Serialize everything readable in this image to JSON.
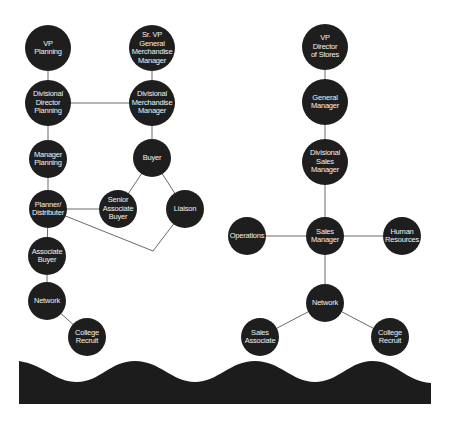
{
  "diagram": {
    "type": "org-chart",
    "colors": {
      "node": "#1e1e1e",
      "node_text": "#f2f2f2",
      "line": "#6a6a6a",
      "wave": "#1c1c1c",
      "background": "#ffffff"
    },
    "nodes": [
      {
        "id": "vp-planning",
        "label": "VP\nPlanning",
        "x": 48,
        "y": 48,
        "r": 23
      },
      {
        "id": "sr-vp-gmm",
        "label": "Sr. VP\nGeneral\nMerchandise\nManager",
        "x": 152,
        "y": 48,
        "r": 23
      },
      {
        "id": "div-director-planning",
        "label": "Divisional\nDirector\nPlanning",
        "x": 48,
        "y": 103,
        "r": 23
      },
      {
        "id": "div-merch-manager",
        "label": "Divisional\nMerchandise\nManager",
        "x": 152,
        "y": 103,
        "r": 23
      },
      {
        "id": "manager-planning",
        "label": "Manager\nPlanning",
        "x": 48,
        "y": 159,
        "r": 19
      },
      {
        "id": "buyer",
        "label": "Buyer",
        "x": 152,
        "y": 158,
        "r": 19
      },
      {
        "id": "planner-distributer",
        "label": "Planner/\nDistributer",
        "x": 48,
        "y": 209,
        "r": 19
      },
      {
        "id": "senior-associate-buyer",
        "label": "Senior\nAssociate\nBuyer",
        "x": 118,
        "y": 209,
        "r": 19
      },
      {
        "id": "liaison",
        "label": "Liaison",
        "x": 185,
        "y": 209,
        "r": 19
      },
      {
        "id": "associate-buyer",
        "label": "Associate\nBuyer",
        "x": 47,
        "y": 256,
        "r": 19
      },
      {
        "id": "network-left",
        "label": "Network",
        "x": 47,
        "y": 301,
        "r": 19
      },
      {
        "id": "college-recruit-left",
        "label": "College\nRecruit",
        "x": 87,
        "y": 337,
        "r": 19
      },
      {
        "id": "vp-director-stores",
        "label": "VP\nDirector\nof Stores",
        "x": 325,
        "y": 47,
        "r": 23
      },
      {
        "id": "general-manager",
        "label": "General\nManager",
        "x": 325,
        "y": 102,
        "r": 23
      },
      {
        "id": "div-sales-manager",
        "label": "Divisional\nSales\nManager",
        "x": 325,
        "y": 162,
        "r": 23
      },
      {
        "id": "operations",
        "label": "Operations",
        "x": 247,
        "y": 236,
        "r": 19
      },
      {
        "id": "sales-manager",
        "label": "Sales\nManager",
        "x": 325,
        "y": 236,
        "r": 19
      },
      {
        "id": "human-resources",
        "label": "Human\nResources",
        "x": 402,
        "y": 236,
        "r": 19
      },
      {
        "id": "network-right",
        "label": "Network",
        "x": 325,
        "y": 303,
        "r": 19
      },
      {
        "id": "sales-associate",
        "label": "Sales\nAssociate",
        "x": 260,
        "y": 337,
        "r": 19
      },
      {
        "id": "college-recruit-right",
        "label": "College\nRecruit",
        "x": 390,
        "y": 337,
        "r": 19
      }
    ],
    "edges": [
      {
        "from": "vp-planning",
        "to": "div-director-planning"
      },
      {
        "from": "sr-vp-gmm",
        "to": "div-merch-manager"
      },
      {
        "from": "div-director-planning",
        "to": "div-merch-manager"
      },
      {
        "from": "div-director-planning",
        "to": "manager-planning"
      },
      {
        "from": "div-merch-manager",
        "to": "buyer"
      },
      {
        "from": "manager-planning",
        "to": "planner-distributer"
      },
      {
        "from": "buyer",
        "to": "senior-associate-buyer"
      },
      {
        "from": "buyer",
        "to": "liaison"
      },
      {
        "from": "planner-distributer",
        "to": "senior-associate-buyer"
      },
      {
        "from": "planner-distributer",
        "to": "liaison",
        "via": [
          153,
          251
        ]
      },
      {
        "from": "planner-distributer",
        "to": "associate-buyer"
      },
      {
        "from": "associate-buyer",
        "to": "network-left"
      },
      {
        "from": "network-left",
        "to": "college-recruit-left"
      },
      {
        "from": "vp-director-stores",
        "to": "general-manager"
      },
      {
        "from": "general-manager",
        "to": "div-sales-manager"
      },
      {
        "from": "div-sales-manager",
        "to": "sales-manager"
      },
      {
        "from": "operations",
        "to": "sales-manager"
      },
      {
        "from": "sales-manager",
        "to": "human-resources"
      },
      {
        "from": "sales-manager",
        "to": "network-right"
      },
      {
        "from": "network-right",
        "to": "sales-associate"
      },
      {
        "from": "network-right",
        "to": "college-recruit-right"
      }
    ],
    "wave": {
      "path": "M19,361 C45,365 55,382 77,382 C100,382 110,361 135,361 C160,361 172,382 195,382 C218,382 230,361 255,361 C280,361 292,382 315,382 C338,382 350,361 372,361 C396,361 405,381 431,383 L431,404 L19,404 Z"
    }
  }
}
